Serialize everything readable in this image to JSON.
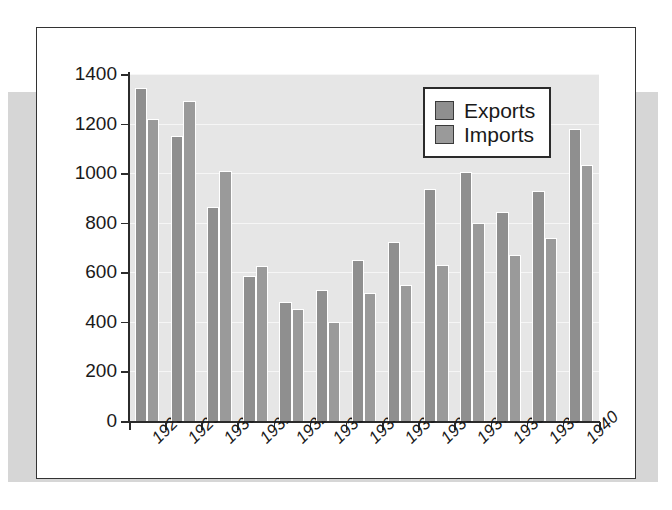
{
  "chart_data": {
    "type": "bar",
    "title": "",
    "subtitle": "",
    "xlabel": "",
    "ylabel": "",
    "ylim": [
      0,
      1400
    ],
    "yticks": [
      0,
      200,
      400,
      600,
      800,
      1000,
      1200,
      1400
    ],
    "ytick_labels": [
      "0",
      "200",
      "400",
      "600",
      "800",
      "1000",
      "1200",
      "1400"
    ],
    "grid": true,
    "legend_position": "top-right",
    "categories": [
      "1928",
      "1929",
      "1930",
      "1931",
      "1932",
      "1933",
      "1934",
      "1935",
      "1936",
      "1937",
      "1938",
      "1939",
      "1940"
    ],
    "series": [
      {
        "name": "Exports",
        "color": "#8f8f8f",
        "values": [
          1344,
          1148,
          865,
          585,
          482,
          528,
          650,
          723,
          938,
          1003,
          843,
          930,
          1180
        ]
      },
      {
        "name": "Imports",
        "color": "#9a9a9a",
        "values": [
          1218,
          1293,
          1008,
          625,
          450,
          398,
          515,
          548,
          628,
          797,
          668,
          740,
          1033
        ]
      }
    ]
  },
  "legend": {
    "items": [
      {
        "label": "Exports",
        "color": "#8f8f8f"
      },
      {
        "label": "Imports",
        "color": "#9a9a9a"
      }
    ]
  },
  "colors": {
    "plot_background": "#e6e6e6",
    "figure_background": "#ffffff",
    "backdrop": "#d6d6d6",
    "frame_border": "#333333",
    "axis": "#2b2b2b",
    "gridline": "#f6f6f6",
    "text": "#1a1a1a"
  }
}
